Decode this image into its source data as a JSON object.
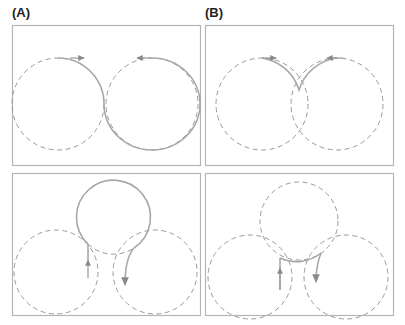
{
  "panels": {
    "a": {
      "label": "(A)"
    },
    "b": {
      "label": "(B)"
    }
  },
  "colors": {
    "frame": "#b5b5b5",
    "solid_path": "#a8a8a8",
    "dashed_circle": "#9a9a9a",
    "label": "#222222"
  }
}
